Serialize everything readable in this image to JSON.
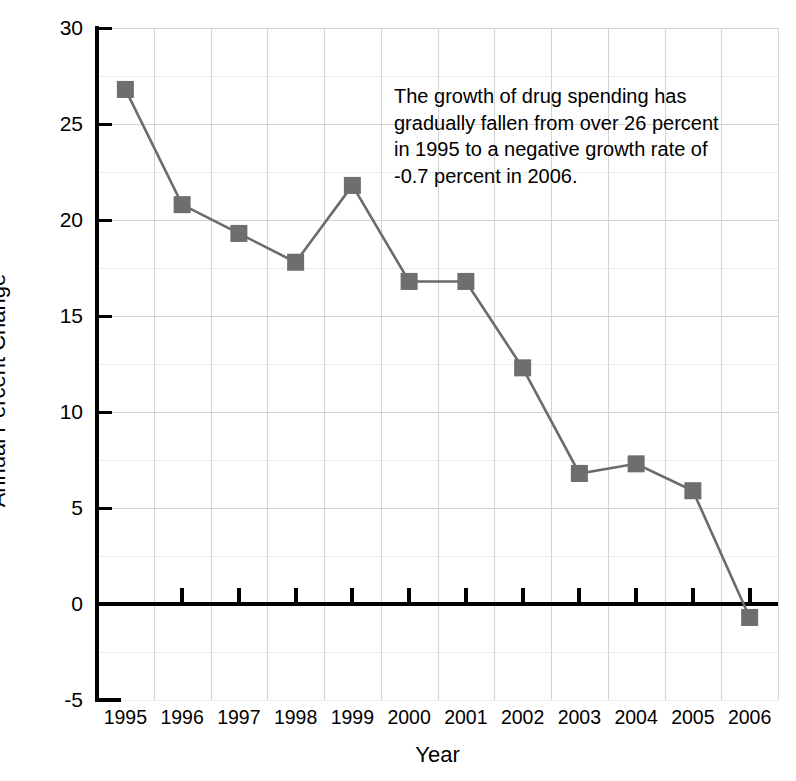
{
  "chart_data": {
    "type": "line",
    "title": "",
    "xlabel": "Year",
    "ylabel": "Annual Percent Change",
    "categories": [
      "1995",
      "1996",
      "1997",
      "1998",
      "1999",
      "2000",
      "2001",
      "2002",
      "2003",
      "2004",
      "2005",
      "2006"
    ],
    "values": [
      26.8,
      20.8,
      19.3,
      17.8,
      21.8,
      16.8,
      16.8,
      12.3,
      6.8,
      7.3,
      5.9,
      -0.7
    ],
    "series": [
      {
        "name": "Annual Percent Change",
        "values": [
          26.8,
          20.8,
          19.3,
          17.8,
          21.8,
          16.8,
          16.8,
          12.3,
          6.8,
          7.3,
          5.9,
          -0.7
        ]
      }
    ],
    "ylim": [
      -5,
      30
    ],
    "ytick_labels": [
      "30",
      "25",
      "20",
      "15",
      "10",
      "5",
      "0",
      "-5"
    ],
    "ytick_values": [
      30,
      25,
      20,
      15,
      10,
      5,
      0,
      -5
    ],
    "ytick_step": 5,
    "grid": true,
    "grid_minor_step": 2.5,
    "legend": "none",
    "zero_line": true,
    "marker": "square",
    "annotations": [
      {
        "text": "The growth of drug spending has gradually fallen from over 26 percent in 1995 to a negative growth rate of -0.7 percent in 2006.",
        "lines": [
          "The growth of drug spending has",
          "gradually fallen from over 26 percent",
          "in 1995 to a negative growth rate of",
          "-0.7 percent in 2006."
        ]
      }
    ]
  },
  "colors": {
    "series_line": "#6b6b6b",
    "marker_fill": "#6e6e6e",
    "axis": "#000000",
    "grid_major": "#d4d4d4",
    "grid_minor": "#ededed",
    "background": "#ffffff",
    "text": "#000000"
  }
}
